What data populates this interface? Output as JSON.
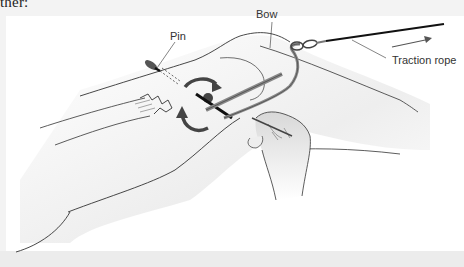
{
  "page": {
    "text_fragment": "ther:"
  },
  "figure": {
    "labels": {
      "pin": "Pin",
      "bow": "Bow",
      "traction_rope": "Traction rope"
    },
    "annotations": {
      "traction_direction": "right",
      "rotation_arrows": 2
    },
    "colors": {
      "panel_background": "#ffffff",
      "page_background": "#f3f3f3",
      "outline": "#333333",
      "skin_shade": "#e6e6e6",
      "rope": "#111111",
      "bow": "#8a8a8a"
    }
  }
}
